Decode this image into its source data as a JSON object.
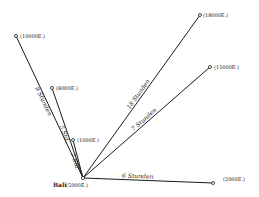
{
  "diagram": {
    "center": {
      "name": "Bali",
      "elevation": "(5000E.)",
      "x": 83,
      "y": 178
    },
    "routes": [
      {
        "id": "r10000",
        "to_label": "(10000E.)",
        "duration": "8 Stunden",
        "x": 16,
        "y": 36,
        "lx": 20,
        "ly": 38
      },
      {
        "id": "r8000",
        "to_label": "(8000E.)",
        "duration": "5 Std.",
        "x": 52,
        "y": 88,
        "lx": 56,
        "ly": 90
      },
      {
        "id": "r1000",
        "to_label": "(1000E.)",
        "duration": "2 Std.",
        "x": 73,
        "y": 140,
        "lx": 77,
        "ly": 142
      },
      {
        "id": "r18000",
        "to_label": "(18000E.)",
        "duration": "18 Stunden",
        "x": 200,
        "y": 15,
        "lx": 203,
        "ly": 17
      },
      {
        "id": "r15000",
        "to_label": "(15000E.)",
        "duration": "7 Stunden",
        "x": 210,
        "y": 67,
        "lx": 214,
        "ly": 69
      },
      {
        "id": "r2000",
        "to_label": "(2000E.)",
        "duration": "6 Stunden",
        "x": 213,
        "y": 183,
        "lx": 223,
        "ly": 181
      }
    ]
  }
}
